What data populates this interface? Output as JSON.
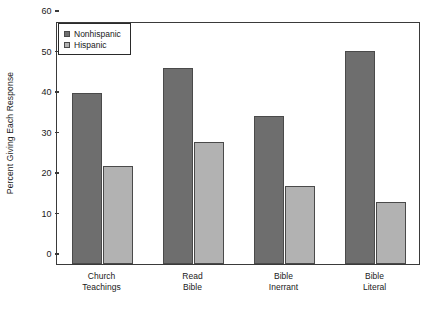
{
  "chart_data": {
    "type": "bar",
    "title": "",
    "xlabel": "",
    "ylabel": "Percent Giving Each Response",
    "ylim": [
      0,
      60
    ],
    "yticks": [
      0,
      10,
      20,
      30,
      40,
      50,
      60
    ],
    "grid": false,
    "legend_position": "top-left",
    "categories": [
      "Church Teachings",
      "Read Bible",
      "Bible Inerrant",
      "Bible Literal"
    ],
    "category_lines": [
      [
        "Church",
        "Teachings"
      ],
      [
        "Read",
        "Bible"
      ],
      [
        "Bible",
        "Inerrant"
      ],
      [
        "Bible",
        "Literal"
      ]
    ],
    "series": [
      {
        "name": "Nonhispanic",
        "color": "#6e6e6e",
        "values": [
          42.2,
          48.3,
          36.5,
          52.5
        ]
      },
      {
        "name": "Hispanic",
        "color": "#b2b2b2",
        "values": [
          24.1,
          30.2,
          19.3,
          15.4
        ]
      }
    ]
  },
  "legend": {
    "items": [
      {
        "label": "Nonhispanic",
        "swatch": "#6e6e6e"
      },
      {
        "label": "Hispanic",
        "swatch": "#b2b2b2"
      }
    ]
  },
  "colors": {
    "axis": "#3a3a3a",
    "bar_dark": "#6e6e6e",
    "bar_light": "#b2b2b2",
    "background": "#ffffff",
    "text": "#1a1a1a"
  }
}
